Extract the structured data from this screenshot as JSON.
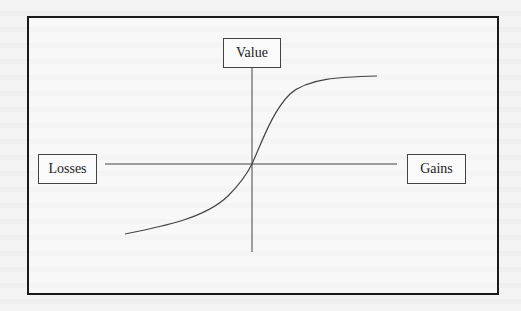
{
  "diagram": {
    "labels": {
      "value": "Value",
      "losses": "Losses",
      "gains": "Gains"
    },
    "axes": {
      "horizontal": {
        "x1": 105,
        "x2": 397,
        "y": 164
      },
      "vertical": {
        "x": 252,
        "y1": 67,
        "y2": 252
      }
    },
    "curve": {
      "description": "S-shaped value curve: concave for gains, convex and steeper for losses",
      "points": [
        [
          125,
          234
        ],
        [
          200,
          217
        ],
        [
          235,
          195
        ],
        [
          252,
          164
        ],
        [
          268,
          128
        ],
        [
          290,
          92
        ],
        [
          330,
          80
        ],
        [
          377,
          76
        ]
      ]
    },
    "colors": {
      "frame": "#1a1a1a",
      "line": "#444444",
      "background": "#f4f4f4"
    }
  }
}
